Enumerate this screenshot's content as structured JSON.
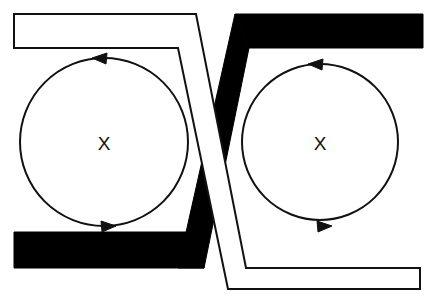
{
  "figure": {
    "background_color": "#ffffff",
    "stroke_color": "#111111",
    "fill_black": "#000000",
    "fill_white": "#ffffff",
    "width": 427,
    "height": 302
  },
  "loops": [
    {
      "id": "left-loop",
      "center_label": "X",
      "cx": 104,
      "cy": 142,
      "r": 84,
      "direction": "counter-clockwise",
      "top_arrow_direction": "left",
      "bottom_arrow_direction": "right"
    },
    {
      "id": "right-loop",
      "center_label": "X",
      "cx": 320,
      "cy": 142,
      "r": 78,
      "direction": "counter-clockwise",
      "top_arrow_direction": "left",
      "bottom_arrow_direction": "right"
    }
  ],
  "bands": [
    {
      "id": "white-band",
      "style": "outlined-white",
      "fill": "#ffffff",
      "stroke": "#111111",
      "route": "top-left to bottom-right, passing over the black band",
      "layer": "front"
    },
    {
      "id": "black-band",
      "style": "solid-black",
      "fill": "#000000",
      "stroke": "#000000",
      "route": "top-right to bottom-left, passing under the white band",
      "layer": "back"
    }
  ],
  "arrows": {
    "head_length": 15,
    "head_width": 11,
    "color": "#111111"
  }
}
